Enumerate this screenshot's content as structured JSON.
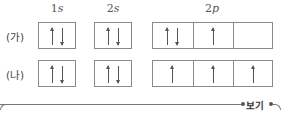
{
  "headers": {
    "s1": {
      "num": "1",
      "sub": "s"
    },
    "s2": {
      "num": "2",
      "sub": "s"
    },
    "p2": {
      "num": "2",
      "sub": "p"
    }
  },
  "rows": [
    {
      "label": "(가)",
      "orbitals": {
        "1s": [
          "up",
          "down"
        ],
        "2s": [
          "up",
          "down"
        ],
        "2p": [
          [
            "up",
            "down"
          ],
          [
            "up"
          ],
          []
        ]
      }
    },
    {
      "label": "(나)",
      "orbitals": {
        "1s": [
          "up",
          "down"
        ],
        "2s": [
          "up",
          "down"
        ],
        "2p": [
          [
            "up"
          ],
          [
            "up"
          ],
          [
            "up"
          ]
        ]
      }
    }
  ],
  "footer": {
    "badge": "보기"
  },
  "colors": {
    "border": "#8a8a8a",
    "arrow": "#555555",
    "text": "#333333"
  }
}
